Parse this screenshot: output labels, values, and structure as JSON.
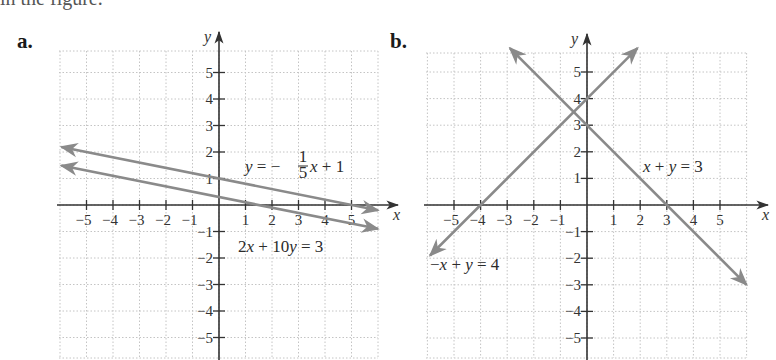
{
  "caption_partial": "in the figure.",
  "chart_data": [
    {
      "type": "line",
      "panel": "a.",
      "title": "",
      "xlabel": "x",
      "ylabel": "y",
      "xlim": [
        -6,
        6
      ],
      "ylim": [
        -6,
        6
      ],
      "grid": true,
      "x_ticks": [
        -5,
        -4,
        -3,
        -2,
        -1,
        1,
        2,
        3,
        4,
        5
      ],
      "y_ticks": [
        5,
        4,
        3,
        2,
        1,
        -1,
        -2,
        -3,
        -4,
        -5
      ],
      "series": [
        {
          "name": "y = -1/5x + 1",
          "label_display": "y = −⅕x + 1",
          "slope": -0.2,
          "intercept": 1,
          "x": [
            -5.95,
            6
          ],
          "y": [
            2.19,
            -0.2
          ],
          "color": "#8a8a8a"
        },
        {
          "name": "2x + 10y = 3",
          "slope": -0.2,
          "intercept": 0.3,
          "x": [
            -5.95,
            6
          ],
          "y": [
            1.49,
            -0.9
          ],
          "color": "#8a8a8a"
        }
      ],
      "annotations": [
        "y = −1/5 x + 1",
        "2x + 10y = 3"
      ]
    },
    {
      "type": "line",
      "panel": "b.",
      "title": "",
      "xlabel": "x",
      "ylabel": "y",
      "xlim": [
        -6,
        6
      ],
      "ylim": [
        -6,
        6
      ],
      "grid": true,
      "x_ticks": [
        -5,
        -4,
        -3,
        -2,
        -1,
        1,
        2,
        3,
        4,
        5
      ],
      "y_ticks": [
        5,
        4,
        3,
        2,
        1,
        -1,
        -2,
        -3,
        -4,
        -5
      ],
      "series": [
        {
          "name": "x + y = 3",
          "slope": -1,
          "intercept": 3,
          "x": [
            -2.9,
            6
          ],
          "y": [
            5.9,
            -3
          ],
          "color": "#8a8a8a"
        },
        {
          "name": "-x + y = 4",
          "label_display": "−x + y = 4",
          "slope": 1,
          "intercept": 4,
          "x": [
            -5.9,
            1.9
          ],
          "y": [
            -1.9,
            5.9
          ],
          "color": "#8a8a8a"
        }
      ],
      "annotations": [
        "x + y = 3",
        "−x + y = 4"
      ]
    }
  ],
  "panels": {
    "a": {
      "label": "a.",
      "eq1": {
        "lhs": "y",
        "eq": " = −",
        "num": "1",
        "den": "5",
        "var": "x",
        "rest": " + 1"
      },
      "eq2": {
        "c1": "2",
        "v1": "x",
        "mid": " + 10",
        "v2": "y",
        "rest": " = 3"
      }
    },
    "b": {
      "label": "b.",
      "eq1": {
        "v1": "x",
        "mid": " + ",
        "v2": "y",
        "rest": " = 3"
      },
      "eq2": {
        "pre": "−",
        "v1": "x",
        "mid": " + ",
        "v2": "y",
        "rest": " = 4"
      }
    }
  },
  "axis_names": {
    "x": "x",
    "y": "y"
  }
}
